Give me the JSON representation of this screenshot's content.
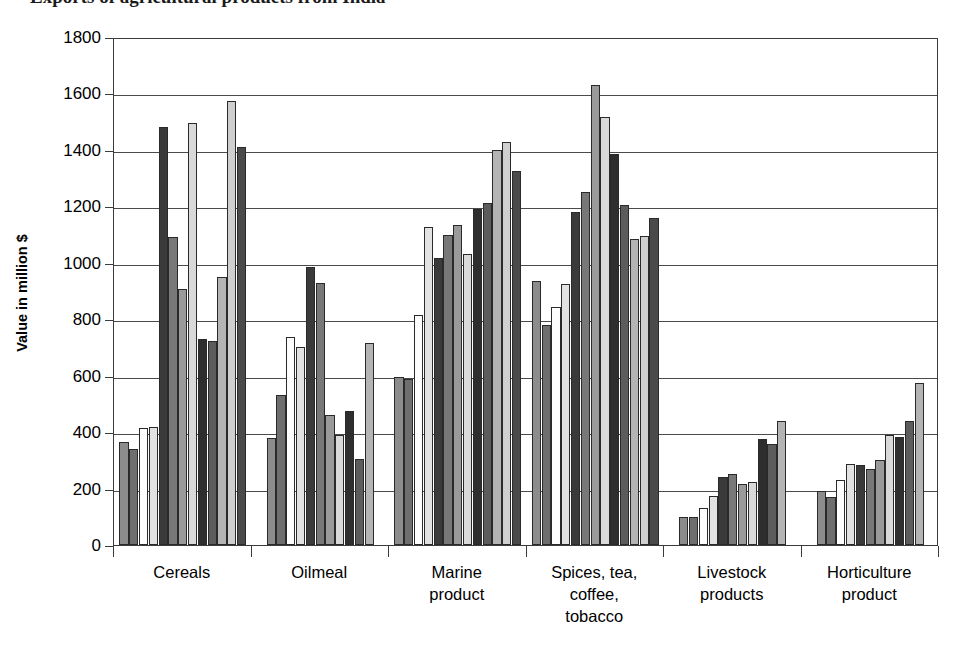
{
  "title": "Exports of agricultural products from India",
  "axis": {
    "ylabel": "Value in million $",
    "yticks": [
      "0",
      "200",
      "400",
      "600",
      "800",
      "1000",
      "1200",
      "1400",
      "1600",
      "1800"
    ]
  },
  "chart_data": {
    "type": "bar",
    "title": "Exports of agricultural products from India",
    "xlabel": "",
    "ylabel": "Value in million $",
    "ylim": [
      0,
      1800
    ],
    "ytick_step": 200,
    "grid": true,
    "legend": "none",
    "bars_per_group": 10,
    "categories": [
      "Cereals",
      "Oilmeal",
      "Marine product",
      "Spices, tea, coffee, tobacco",
      "Livestock products",
      "Horticulture product"
    ],
    "category_labels_multiline": [
      [
        "Cereals"
      ],
      [
        "Oilmeal"
      ],
      [
        "Marine",
        "product"
      ],
      [
        "Spices, tea,",
        "coffee,",
        "tobacco"
      ],
      [
        "Livestock",
        "products"
      ],
      [
        "Horticulture",
        "product"
      ]
    ],
    "series_values": {
      "Cereals": [
        365,
        340,
        415,
        418,
        1480,
        1093,
        908,
        1495,
        730,
        722,
        950,
        1572,
        1412
      ],
      "Oilmeal": [
        380,
        533,
        737,
        700,
        985,
        928,
        462,
        390,
        475,
        305,
        715
      ],
      "Marine product": [
        597,
        588,
        815,
        1128,
        1018,
        1098,
        1135,
        1032,
        1190,
        1213,
        1400,
        1428,
        1325
      ],
      "Spices, tea, coffee, tobacco": [
        935,
        780,
        845,
        925,
        1180,
        1250,
        1630,
        1518,
        1385,
        1205,
        1085,
        1095,
        1158
      ],
      "Livestock products": [
        98,
        100,
        130,
        175,
        240,
        250,
        215,
        222,
        375,
        358,
        440
      ],
      "Horticulture product": [
        192,
        170,
        232,
        288,
        285,
        270,
        302,
        390,
        382,
        438,
        575
      ]
    },
    "groups": [
      {
        "category": "Cereals",
        "values": [
          365,
          340,
          415,
          418,
          1480,
          1093,
          908,
          1495,
          730,
          722,
          950,
          1572,
          1412
        ]
      },
      {
        "category": "Oilmeal",
        "values": [
          380,
          533,
          737,
          700,
          985,
          928,
          462,
          390,
          475,
          305,
          715
        ]
      },
      {
        "category": "Marine product",
        "values": [
          597,
          588,
          815,
          1128,
          1018,
          1098,
          1135,
          1032,
          1190,
          1213,
          1400,
          1428,
          1325
        ]
      },
      {
        "category": "Spices, tea, coffee, tobacco",
        "values": [
          935,
          780,
          845,
          925,
          1180,
          1250,
          1630,
          1518,
          1385,
          1205,
          1085,
          1095,
          1158
        ]
      },
      {
        "category": "Livestock products",
        "values": [
          98,
          100,
          130,
          175,
          240,
          250,
          215,
          222,
          375,
          358,
          440
        ]
      },
      {
        "category": "Horticulture product",
        "values": [
          192,
          170,
          232,
          288,
          285,
          270,
          302,
          390,
          382,
          438,
          575
        ]
      }
    ]
  },
  "style": {
    "bar_shades": [
      "#8c8c8c",
      "#6e6e6e",
      "#fdfdfd",
      "#e2e2e2",
      "#3a3a3a",
      "#787878",
      "#9a9a9a",
      "#d9d9d9",
      "#2e2e2e",
      "#5c5c5c",
      "#b4b4b4",
      "#cfcfcf",
      "#4a4a4a"
    ],
    "axis_color": "#3b3b3b",
    "grid_color": "#4a4a4a",
    "background": "#ffffff"
  }
}
